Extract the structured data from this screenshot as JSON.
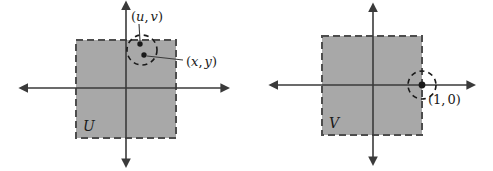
{
  "figure": {
    "background_color": "#ffffff",
    "ink_color": "#3a3a3a",
    "square_fill": "#a8a8a8",
    "square_stroke": "#4d4d4d",
    "dot_color": "#1a1a1a",
    "width": 493,
    "height": 171
  },
  "panels": [
    {
      "id": "left",
      "region_label": "U",
      "axes": {
        "x_axis": {
          "y": 88,
          "x_start": 28,
          "x_end": 222
        },
        "y_axis": {
          "x": 126,
          "y_start": 10,
          "y_end": 160
        },
        "origin": {
          "x": 126,
          "y": 88
        }
      },
      "square": {
        "x": 76,
        "y": 40,
        "width": 100,
        "height": 98,
        "style": "dashed"
      },
      "neighborhood": {
        "cx": 142,
        "cy": 50,
        "r": 15,
        "style": "dashed"
      },
      "points": [
        {
          "label": "(u, v)",
          "label_text_paren_open": "(",
          "label_text_paren_close": ")",
          "var1": "u",
          "var2": "v",
          "cx": 140,
          "cy": 44,
          "label_x": 131,
          "label_y": 20
        },
        {
          "label": "(x, y)",
          "var1": "x",
          "var2": "y",
          "cx": 144,
          "cy": 55,
          "label_x": 185,
          "label_y": 66
        }
      ]
    },
    {
      "id": "right",
      "region_label": "V",
      "axes": {
        "x_axis": {
          "y": 85,
          "x_start": 278,
          "x_end": 468
        },
        "y_axis": {
          "x": 373,
          "y_start": 12,
          "y_end": 158
        },
        "origin": {
          "x": 373,
          "y": 85
        }
      },
      "square": {
        "x": 322,
        "y": 36,
        "width": 100,
        "height": 99,
        "style": "dashed"
      },
      "neighborhood": {
        "cx": 422,
        "cy": 85,
        "r": 14,
        "style": "dashed"
      },
      "points": [
        {
          "label": "(1, 0)",
          "var1": "1",
          "var2": "0",
          "cx": 422,
          "cy": 85,
          "label_x": 428,
          "label_y": 103
        }
      ]
    }
  ],
  "labels": {
    "u_v": {
      "open": "(",
      "first": "u",
      "comma": ",",
      "second": "v",
      "close": ")"
    },
    "x_y": {
      "open": "(",
      "first": "x",
      "comma": ",",
      "second": "y",
      "close": ")"
    },
    "one_zero": {
      "open": "(",
      "first": "1",
      "comma": ",",
      "second": "0",
      "close": ")"
    },
    "set_u": "U",
    "set_v": "V"
  }
}
